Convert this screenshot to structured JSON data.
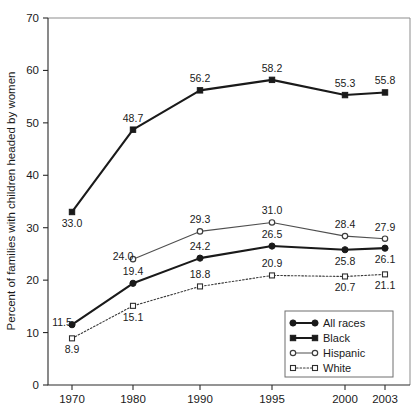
{
  "chart_data": {
    "type": "line",
    "title": "",
    "xlabel": "",
    "ylabel": "Percent of families with children headed by women",
    "categories": [
      "1970",
      "1980",
      "1990",
      "1995",
      "2000",
      "2003"
    ],
    "xticklabels": [
      "1970",
      "1980",
      "1990",
      "1995",
      "2000",
      "2003"
    ],
    "yticklabels": [
      "0",
      "10",
      "20",
      "30",
      "40",
      "50",
      "60",
      "70"
    ],
    "yticks": [
      0,
      10,
      20,
      30,
      40,
      50,
      60,
      70
    ],
    "ylim": [
      0,
      70
    ],
    "grid": false,
    "legend_position": "bottom-right",
    "series": [
      {
        "name": "All races",
        "marker": "filled-circle",
        "linestyle": "solid",
        "values": [
          11.5,
          19.4,
          24.2,
          26.5,
          25.8,
          26.1
        ],
        "labels": [
          "11.5",
          "19.4",
          "24.2",
          "26.5",
          "25.8",
          "26.1"
        ],
        "label_positions": [
          "left",
          "above",
          "above",
          "above",
          "below",
          "below"
        ]
      },
      {
        "name": "Black",
        "marker": "filled-square",
        "linestyle": "solid",
        "values": [
          33.0,
          48.7,
          56.2,
          58.2,
          55.3,
          55.8
        ],
        "labels": [
          "33.0",
          "48.7",
          "56.2",
          "58.2",
          "55.3",
          "55.8"
        ],
        "label_positions": [
          "below",
          "above",
          "above",
          "above",
          "above",
          "above"
        ]
      },
      {
        "name": "Hispanic",
        "marker": "open-circle",
        "linestyle": "solid",
        "values": [
          null,
          24.0,
          29.3,
          31.0,
          28.4,
          27.9
        ],
        "labels": [
          "",
          "24.0",
          "29.3",
          "31.0",
          "28.4",
          "27.9"
        ],
        "label_positions": [
          "",
          "left",
          "above",
          "above",
          "above",
          "above"
        ]
      },
      {
        "name": "White",
        "marker": "open-square",
        "linestyle": "dotted",
        "values": [
          8.9,
          15.1,
          18.8,
          20.9,
          20.7,
          21.1
        ],
        "labels": [
          "8.9",
          "15.1",
          "18.8",
          "20.9",
          "20.7",
          "21.1"
        ],
        "label_positions": [
          "below",
          "below",
          "above",
          "above",
          "below",
          "below"
        ]
      }
    ]
  },
  "legend": {
    "entries": [
      {
        "label": "All races"
      },
      {
        "label": "Black"
      },
      {
        "label": "Hispanic"
      },
      {
        "label": "White"
      }
    ]
  }
}
